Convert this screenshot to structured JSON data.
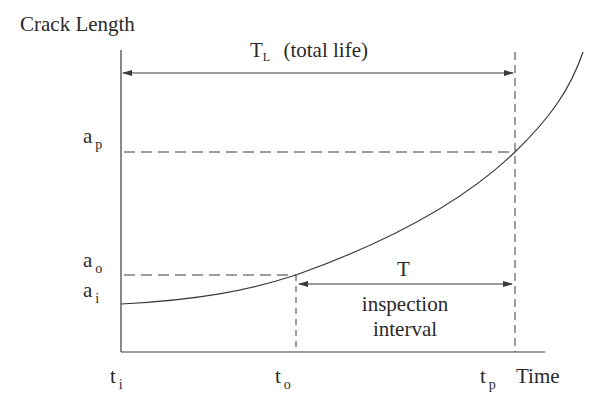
{
  "diagram": {
    "y_axis_label": "Crack Length",
    "x_axis_label": "Time",
    "total_life": {
      "symbol": "T",
      "subscript": "L",
      "text": "(total life)"
    },
    "inspection": {
      "symbol": "T",
      "line1": "inspection",
      "line2": "interval"
    },
    "y_ticks": [
      {
        "base": "a",
        "sub": "p"
      },
      {
        "base": "a",
        "sub": "o"
      },
      {
        "base": "a",
        "sub": "i"
      }
    ],
    "x_ticks": [
      {
        "base": "t",
        "sub": "i"
      },
      {
        "base": "t",
        "sub": "o"
      },
      {
        "base": "t",
        "sub": "p"
      }
    ],
    "colors": {
      "line": "#3a3a3a",
      "background": "#ffffff"
    }
  }
}
